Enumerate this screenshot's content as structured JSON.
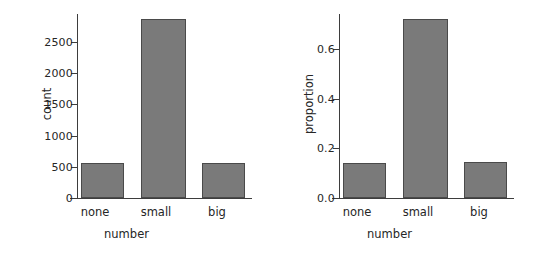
{
  "figure": {
    "background": "#ffffff",
    "bar_fill": "#7a7a7a",
    "bar_edge": "#4a4a4a",
    "axis_color": "#3d3d3d"
  },
  "chart_data": [
    {
      "type": "bar",
      "title": "",
      "xlabel": "number",
      "ylabel": "count",
      "categories": [
        "none",
        "small",
        "big"
      ],
      "values": [
        550,
        2800,
        555
      ],
      "yticks": [
        "0",
        "500",
        "1000",
        "1500",
        "2000",
        "2500"
      ],
      "ytick_values": [
        0,
        500,
        1000,
        1500,
        2000,
        2500
      ],
      "ylim": [
        0,
        2880
      ],
      "xlim_categories": 3,
      "grid": false,
      "legend": "none"
    },
    {
      "type": "bar",
      "title": "",
      "xlabel": "number",
      "ylabel": "proportion",
      "categories": [
        "none",
        "small",
        "big"
      ],
      "values": [
        0.142,
        0.718,
        0.143
      ],
      "yticks": [
        "0.0",
        "0.2",
        "0.4",
        "0.6"
      ],
      "ytick_values": [
        0.0,
        0.2,
        0.4,
        0.6
      ],
      "ylim": [
        0,
        0.74
      ],
      "xlim_categories": 3,
      "grid": false,
      "legend": "none"
    }
  ]
}
